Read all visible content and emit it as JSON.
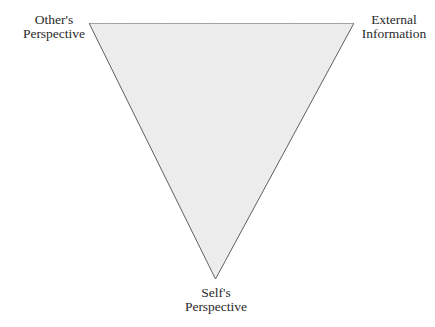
{
  "diagram": {
    "type": "inverted-triangle",
    "fill_color": "#ececec",
    "stroke_color": "#555555",
    "vertices": {
      "top_left": {
        "label_lines": [
          "Other's",
          "Perspective"
        ]
      },
      "top_right": {
        "label_lines": [
          "External",
          "Information"
        ]
      },
      "bottom": {
        "label_lines": [
          "Self's",
          "Perspective"
        ]
      }
    }
  }
}
